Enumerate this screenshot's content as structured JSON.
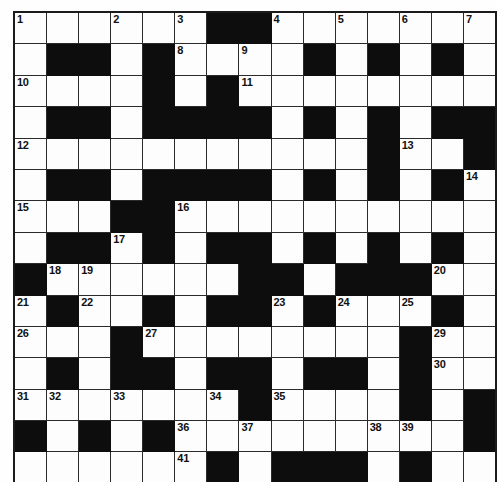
{
  "puzzle": {
    "title": "Crossword Grid",
    "rows": 15,
    "cols": 15,
    "colors": {
      "block": "#0d0d0d",
      "cell": "#fdfdfd",
      "grid_line": "#2a2a2a",
      "number_text": "#111111",
      "page_background": "#ffffff"
    },
    "legend": {
      "block_symbol": "#",
      "open_symbol": "."
    },
    "grid": [
      "......##.......",
      ".##.#....#.#.#.",
      "....#.#........",
      ".##.####.#.#.##",
      "...........#..#",
      ".##.####.#.#.#.",
      "...##..........",
      ".##.#.##.#.#.#.",
      "#......##.###..",
      ".#..#.##.#...#.",
      "....................",
      ".#.##.##.##.#..",
      "...............",
      "#.#.#.........#",
      "......#.###.#.."
    ],
    "black_cells": [
      [
        1,
        7
      ],
      [
        1,
        8
      ],
      [
        2,
        2
      ],
      [
        2,
        3
      ],
      [
        2,
        5
      ],
      [
        2,
        10
      ],
      [
        2,
        12
      ],
      [
        2,
        14
      ],
      [
        3,
        5
      ],
      [
        3,
        7
      ],
      [
        4,
        2
      ],
      [
        4,
        3
      ],
      [
        4,
        5
      ],
      [
        4,
        6
      ],
      [
        4,
        7
      ],
      [
        4,
        8
      ],
      [
        4,
        10
      ],
      [
        4,
        12
      ],
      [
        4,
        14
      ],
      [
        4,
        15
      ],
      [
        5,
        12
      ],
      [
        5,
        15
      ],
      [
        6,
        2
      ],
      [
        6,
        3
      ],
      [
        6,
        5
      ],
      [
        6,
        6
      ],
      [
        6,
        7
      ],
      [
        6,
        8
      ],
      [
        6,
        10
      ],
      [
        6,
        12
      ],
      [
        6,
        14
      ],
      [
        7,
        4
      ],
      [
        7,
        5
      ],
      [
        8,
        2
      ],
      [
        8,
        3
      ],
      [
        8,
        5
      ],
      [
        8,
        7
      ],
      [
        8,
        8
      ],
      [
        8,
        10
      ],
      [
        8,
        12
      ],
      [
        8,
        14
      ],
      [
        9,
        1
      ],
      [
        9,
        8
      ],
      [
        9,
        9
      ],
      [
        9,
        11
      ],
      [
        9,
        12
      ],
      [
        9,
        13
      ],
      [
        10,
        2
      ],
      [
        10,
        5
      ],
      [
        10,
        7
      ],
      [
        10,
        8
      ],
      [
        10,
        10
      ],
      [
        10,
        14
      ],
      [
        11,
        4
      ],
      [
        11,
        13
      ],
      [
        12,
        2
      ],
      [
        12,
        4
      ],
      [
        12,
        5
      ],
      [
        12,
        7
      ],
      [
        12,
        8
      ],
      [
        12,
        10
      ],
      [
        12,
        11
      ],
      [
        12,
        13
      ],
      [
        13,
        8
      ],
      [
        13,
        13
      ],
      [
        13,
        15
      ],
      [
        14,
        1
      ],
      [
        14,
        3
      ],
      [
        14,
        5
      ],
      [
        14,
        15
      ],
      [
        15,
        7
      ],
      [
        15,
        9
      ],
      [
        15,
        10
      ],
      [
        15,
        11
      ],
      [
        15,
        13
      ]
    ],
    "numbers": [
      {
        "n": 1,
        "row": 1,
        "col": 1
      },
      {
        "n": 2,
        "row": 1,
        "col": 4
      },
      {
        "n": 3,
        "row": 1,
        "col": 6
      },
      {
        "n": 4,
        "row": 1,
        "col": 9
      },
      {
        "n": 5,
        "row": 1,
        "col": 11
      },
      {
        "n": 6,
        "row": 1,
        "col": 13
      },
      {
        "n": 7,
        "row": 1,
        "col": 15
      },
      {
        "n": 8,
        "row": 2,
        "col": 6
      },
      {
        "n": 9,
        "row": 2,
        "col": 8
      },
      {
        "n": 10,
        "row": 3,
        "col": 1
      },
      {
        "n": 11,
        "row": 3,
        "col": 8
      },
      {
        "n": 12,
        "row": 5,
        "col": 1
      },
      {
        "n": 13,
        "row": 5,
        "col": 13
      },
      {
        "n": 14,
        "row": 6,
        "col": 15
      },
      {
        "n": 15,
        "row": 7,
        "col": 1
      },
      {
        "n": 16,
        "row": 7,
        "col": 6
      },
      {
        "n": 17,
        "row": 8,
        "col": 4
      },
      {
        "n": 18,
        "row": 9,
        "col": 2
      },
      {
        "n": 19,
        "row": 9,
        "col": 3
      },
      {
        "n": 20,
        "row": 9,
        "col": 14
      },
      {
        "n": 21,
        "row": 10,
        "col": 1
      },
      {
        "n": 22,
        "row": 10,
        "col": 3
      },
      {
        "n": 23,
        "row": 10,
        "col": 9
      },
      {
        "n": 24,
        "row": 10,
        "col": 11
      },
      {
        "n": 25,
        "row": 10,
        "col": 13
      },
      {
        "n": 26,
        "row": 11,
        "col": 1
      },
      {
        "n": 27,
        "row": 11,
        "col": 5
      },
      {
        "n": 28,
        "row": 11,
        "col": 13
      },
      {
        "n": 29,
        "row": 11,
        "col": 14
      },
      {
        "n": 30,
        "row": 12,
        "col": 14
      },
      {
        "n": 31,
        "row": 13,
        "col": 1
      },
      {
        "n": 32,
        "row": 13,
        "col": 2
      },
      {
        "n": 33,
        "row": 13,
        "col": 4
      },
      {
        "n": 34,
        "row": 13,
        "col": 7
      },
      {
        "n": 35,
        "row": 13,
        "col": 9
      },
      {
        "n": 36,
        "row": 14,
        "col": 6
      },
      {
        "n": 37,
        "row": 14,
        "col": 8
      },
      {
        "n": 38,
        "row": 14,
        "col": 12
      },
      {
        "n": 39,
        "row": 14,
        "col": 13
      },
      {
        "n": 40,
        "row": 14,
        "col": 15
      },
      {
        "n": 41,
        "row": 15,
        "col": 6
      },
      {
        "n": 42,
        "row": 15,
        "col": 11
      },
      {
        "n": 43,
        "row": 16,
        "col": 1
      },
      {
        "n": 44,
        "row": 16,
        "col": 13
      }
    ]
  }
}
